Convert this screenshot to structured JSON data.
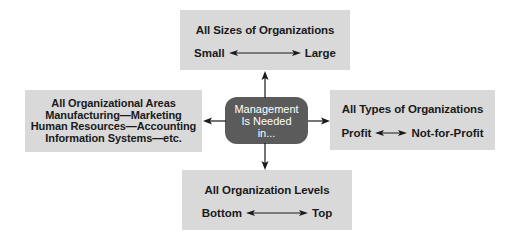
{
  "diagram": {
    "center": {
      "lines": [
        "Management",
        "Is Needed",
        "in..."
      ],
      "fill": "#5b5b5b",
      "text_color": "#ffffff"
    },
    "top": {
      "title": "All Sizes of Organizations",
      "range_start": "Small",
      "range_end": "Large"
    },
    "right": {
      "title": "All Types of Organizations",
      "range_start": "Profit",
      "range_end": "Not-for-Profit"
    },
    "bottom": {
      "title": "All Organization Levels",
      "range_start": "Bottom",
      "range_end": "Top"
    },
    "left": {
      "lines": [
        "All Organizational Areas",
        "Manufacturing—Marketing",
        "Human Resources—Accounting",
        "Information Systems—etc."
      ]
    },
    "box_fill": "#d9d9d9",
    "arrow_color": "#1a1a1a"
  }
}
